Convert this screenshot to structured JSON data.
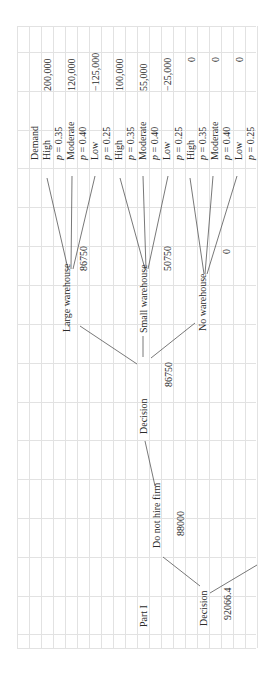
{
  "sheet": {
    "title": "Part I",
    "orientation": "rotated-90-ccw"
  },
  "root": {
    "label": "Decision",
    "value": "92066.4"
  },
  "branch_not_hire": {
    "label": "Do not hire firm",
    "value": "88000"
  },
  "decision_node": {
    "label": "Decision",
    "value": "86750"
  },
  "outcome_header": "Demand",
  "alternatives": [
    {
      "label": "Large warehouse",
      "value": "86750",
      "outcomes": [
        {
          "demand": "High",
          "prob": "p = 0.35",
          "payoff": "200,000"
        },
        {
          "demand": "Moderate",
          "prob": "p = 0.40",
          "payoff": "120,000"
        },
        {
          "demand": "Low",
          "prob": "p = 0.25",
          "payoff": "−125,000"
        }
      ]
    },
    {
      "label": "Small warehouse",
      "value": "50750",
      "outcomes": [
        {
          "demand": "High",
          "prob": "p = 0.35",
          "payoff": "100,000"
        },
        {
          "demand": "Moderate",
          "prob": "p = 0.40",
          "payoff": "55,000"
        },
        {
          "demand": "Low",
          "prob": "p = 0.25",
          "payoff": "−25,000"
        }
      ]
    },
    {
      "label": "No warehouse",
      "value": "0",
      "outcomes": [
        {
          "demand": "High",
          "prob": "p = 0.35",
          "payoff": "0"
        },
        {
          "demand": "Moderate",
          "prob": "p = 0.40",
          "payoff": "0"
        },
        {
          "demand": "Low",
          "prob": "p = 0.25",
          "payoff": "0"
        }
      ]
    }
  ]
}
